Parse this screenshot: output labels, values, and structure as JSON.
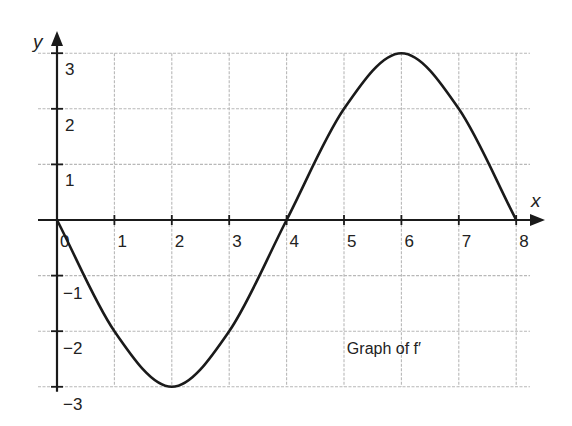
{
  "chart_data": {
    "type": "line",
    "title": "",
    "annotation": {
      "text": "Graph of f′",
      "x": 5.05,
      "y": -2.3
    },
    "xlabel": "x",
    "ylabel": "y",
    "xlim": [
      0,
      8
    ],
    "ylim": [
      -3,
      3
    ],
    "x_ticks": [
      0,
      1,
      2,
      3,
      4,
      5,
      6,
      7,
      8
    ],
    "y_ticks": [
      -3,
      -2,
      -1,
      1,
      2,
      3
    ],
    "x_tick_labels": [
      "0",
      "1",
      "2",
      "3",
      "4",
      "5",
      "6",
      "7",
      "8"
    ],
    "y_tick_labels": [
      "−3",
      "−2",
      "−1",
      "1",
      "2",
      "3"
    ],
    "grid": true,
    "series": [
      {
        "name": "f′",
        "x": [
          0,
          1,
          2,
          3,
          4,
          5,
          6,
          7,
          8
        ],
        "values": [
          0,
          -2,
          -3,
          -2,
          0,
          2,
          3,
          2,
          0
        ]
      }
    ],
    "colors": {
      "curve": "#1a1a1a",
      "grid": "#b8b8b8",
      "axis": "#1a1a1a"
    }
  }
}
